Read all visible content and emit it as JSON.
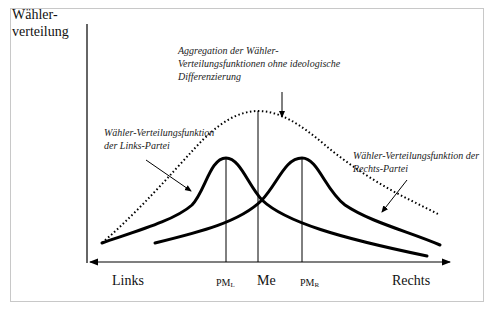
{
  "diagram": {
    "y_axis_label_line1": "Wähler-",
    "y_axis_label_line2": "verteilung",
    "x_axis": {
      "left_label": "Links",
      "right_label": "Rechts",
      "ticks": {
        "pm_left": {
          "main": "PM",
          "sub": "L"
        },
        "median": "Me",
        "pm_right": {
          "main": "PM",
          "sub": "R"
        }
      }
    },
    "annotations": {
      "aggregate": {
        "line1": "Aggregation der Wähler-",
        "line2": "Verteilungsfunktionen ohne ideologische",
        "line3": "Differenzierung"
      },
      "left_party": {
        "line1": "Wähler-Verteilungsfunktion",
        "line2": "der Links-Partei"
      },
      "right_party": {
        "line1": "Wähler-Verteilungsfunktion der",
        "line2": "Rechts-Partei"
      }
    },
    "curves": [
      {
        "name": "aggregate-distribution",
        "style": "dotted",
        "peak_at": "Me"
      },
      {
        "name": "left-party-distribution",
        "style": "solid-thick",
        "peak_at": "PM_L"
      },
      {
        "name": "right-party-distribution",
        "style": "solid-thick",
        "peak_at": "PM_R"
      }
    ],
    "colors": {
      "line": "#000000",
      "frame": "#c8c8c8",
      "background": "#ffffff"
    }
  }
}
